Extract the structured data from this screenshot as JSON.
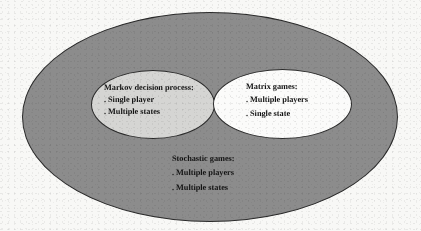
{
  "figure": {
    "name": "nested-venn-diagram-of-game-models",
    "background_color": "#f8f8f6"
  },
  "sets": {
    "outer": {
      "id": "stochastic-games",
      "title": "Stochastic games:",
      "items": [
        "Multiple players",
        "Multiple states"
      ],
      "bullet": ".",
      "fill_color": "#8c8c8c",
      "stroke_color": "#2a2a2a"
    },
    "left_subset": {
      "id": "markov-decision-process",
      "title": "Markov decision process:",
      "items": [
        "Single player",
        "Multiple states"
      ],
      "bullet": ".",
      "fill_color": "#d5d5d3",
      "stroke_color": "#2a2a2a"
    },
    "right_subset": {
      "id": "matrix-games",
      "title": "Matrix games:",
      "items": [
        "Multiple players",
        "Single state"
      ],
      "bullet": ".",
      "fill_color": "#fbfbfa",
      "stroke_color": "#2a2a2a"
    }
  }
}
